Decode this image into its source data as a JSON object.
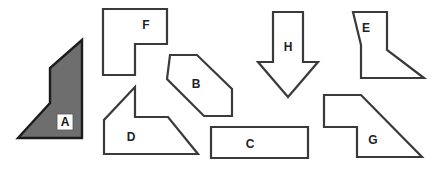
{
  "diagram": {
    "background_color": "#ffffff",
    "outline_color": "#3a3a3a",
    "filled_color": "#6e6e6e",
    "filled_outline_color": "#1c1c1c",
    "label_color": "#222222",
    "width": 433,
    "height": 169
  },
  "shapes": [
    {
      "id": "A",
      "label": "A",
      "kind": "filled-polygon",
      "style": "filled",
      "label_boxed": true,
      "label_x": 65,
      "label_y": 122,
      "points": "82,40 82,138 18,138 50,103 50,68"
    },
    {
      "id": "F",
      "label": "F",
      "kind": "l-shape",
      "style": "outline",
      "label_boxed": false,
      "label_x": 146,
      "label_y": 25,
      "points": "103,9 167,9 167,44 135,44 135,75 103,75"
    },
    {
      "id": "B",
      "label": "B",
      "kind": "hexagon",
      "style": "outline",
      "label_boxed": false,
      "label_x": 196,
      "label_y": 84,
      "points": "170,55 197,55 232,89 232,116 204,116 167,79"
    },
    {
      "id": "D",
      "label": "D",
      "kind": "arrow-polygon",
      "style": "outline",
      "label_boxed": false,
      "label_x": 131,
      "label_y": 137,
      "points": "135,87 135,117 168,117 198,154 104,154 104,120"
    },
    {
      "id": "C",
      "label": "C",
      "kind": "rectangle",
      "style": "outline",
      "label_boxed": false,
      "label_x": 250,
      "label_y": 144,
      "points": "211,127 308,127 308,158 211,158"
    },
    {
      "id": "H",
      "label": "H",
      "kind": "down-arrow",
      "style": "outline",
      "label_boxed": false,
      "label_x": 288,
      "label_y": 47,
      "points": "273,12 303,12 303,62 318,62 288,97 258,62 273,62"
    },
    {
      "id": "E",
      "label": "E",
      "kind": "z-polygon",
      "style": "outline",
      "label_boxed": false,
      "label_x": 366,
      "label_y": 28,
      "points": "353,12 387,12 387,50 424,78 361,78 361,45"
    },
    {
      "id": "G",
      "label": "G",
      "kind": "notched-triangle",
      "style": "outline",
      "label_boxed": false,
      "label_x": 373,
      "label_y": 140,
      "points": "324,95 361,95 422,157 357,157 357,127 324,127"
    }
  ]
}
